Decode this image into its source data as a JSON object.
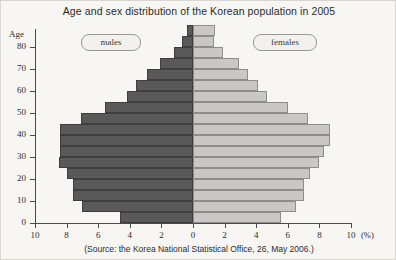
{
  "title": "Age and sex distribution of the Korean population in 2005",
  "source": "(Source: the Korea National Statistical Office, 26, May 2006.)",
  "axis": {
    "y_label": "Age",
    "x_unit": "(%)",
    "y_ticks": [
      "80",
      "70",
      "60",
      "50",
      "40",
      "30",
      "20",
      "10",
      "0"
    ],
    "x_ticks": [
      "10",
      "8",
      "6",
      "4",
      "2",
      "0",
      "2",
      "4",
      "6",
      "8",
      "10"
    ]
  },
  "legend": {
    "males": "males",
    "females": "females"
  },
  "colors": {
    "male_fill": "#595959",
    "male_edge": "#3e3e3e",
    "female_fill": "#c9c8c4",
    "female_edge": "#8e8d89",
    "axis": "#4a4a4a",
    "background": "#f7f6f3"
  },
  "chart_data": {
    "type": "bar",
    "subtype": "population-pyramid",
    "title": "Age and sex distribution of the Korean population in 2005",
    "xlabel": "(%)",
    "ylabel": "Age",
    "xlim": [
      -10,
      10
    ],
    "ylim": [
      0,
      88
    ],
    "grid": false,
    "legend_position": "inside-top",
    "categories": [
      "0-4",
      "5-9",
      "10-14",
      "15-19",
      "20-24",
      "25-29",
      "30-34",
      "35-39",
      "40-44",
      "45-49",
      "50-54",
      "55-59",
      "60-64",
      "65-69",
      "70-74",
      "75-79",
      "80-84",
      "85+"
    ],
    "series": [
      {
        "name": "males",
        "direction": "left",
        "values": [
          4.6,
          7.0,
          7.6,
          7.6,
          8.0,
          8.5,
          8.4,
          8.4,
          8.4,
          7.1,
          5.6,
          4.2,
          3.6,
          2.9,
          2.1,
          1.2,
          0.7,
          0.4
        ]
      },
      {
        "name": "females",
        "direction": "right",
        "values": [
          5.6,
          6.5,
          7.0,
          7.0,
          7.4,
          8.0,
          8.3,
          8.7,
          8.7,
          7.3,
          6.0,
          4.7,
          4.1,
          3.5,
          2.9,
          1.9,
          1.3,
          1.4
        ]
      }
    ]
  }
}
